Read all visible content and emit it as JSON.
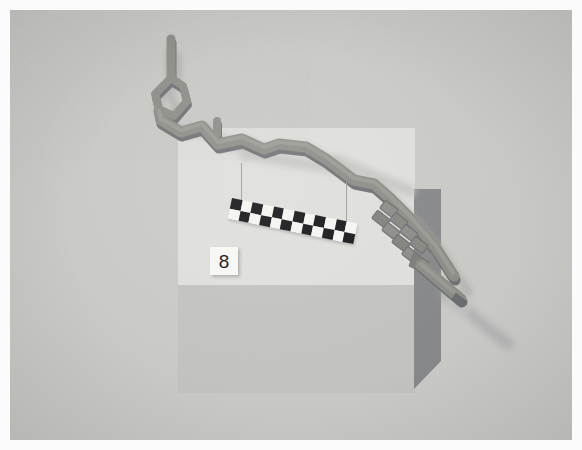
{
  "photo": {
    "title": "Photograph of a physical scale model of a winding channel",
    "border_color": "#fbfbfb",
    "background_color": "#c9cac6"
  },
  "scene": {
    "backdrop": {
      "upper_panel_color": "#dedfdb",
      "lower_panel_color": "#c2c3bf",
      "cast_shadow_color": "#87888a"
    },
    "model": {
      "object_name": "winding channel model",
      "material_color": "#8a8b87",
      "shade_top_color": "#97988f",
      "shade_side_color": "#76777a",
      "shadow_color": "#b0b1ad",
      "features": [
        "vertical inlet stem",
        "diamond island loop",
        "short side branch stub",
        "meandering main channel",
        "stepped weir ladder",
        "outlet tail"
      ]
    },
    "scale_bar": {
      "name": "checkerboard photogrammetry scale bar",
      "rows": 2,
      "columns": 12,
      "dark_color": "#17171a",
      "light_color": "#f4f4f1",
      "rotation_degrees": 11.5,
      "pattern": [
        [
          "b",
          "w",
          "b",
          "w",
          "b",
          "w",
          "b",
          "w",
          "b",
          "w",
          "b",
          "w"
        ],
        [
          "w",
          "b",
          "w",
          "b",
          "w",
          "b",
          "w",
          "b",
          "w",
          "b",
          "w",
          "b"
        ]
      ]
    },
    "label_card": {
      "name": "specimen number card",
      "value": "8",
      "card_color": "#f7f7f4",
      "text_color": "#141416"
    }
  }
}
